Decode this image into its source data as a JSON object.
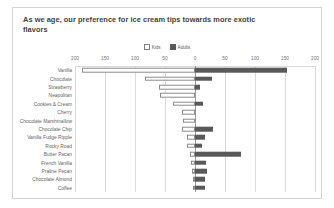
{
  "chart_data": {
    "type": "bar",
    "subtype": "diverging-tornado",
    "title": "As we age, our preference for ice cream tips towards more exotic flavors",
    "xlabel": "",
    "ylabel": "",
    "orientation": "horizontal",
    "grid": true,
    "legend_position": "top-center",
    "axis_zero_center": true,
    "xlim": [
      -200,
      200
    ],
    "tick_values": [
      -200,
      -150,
      -100,
      -50,
      0,
      50,
      100,
      150,
      200
    ],
    "tick_labels": [
      "200",
      "150",
      "100",
      "50",
      "0",
      "50",
      "100",
      "150",
      "200"
    ],
    "categories": [
      "Vanilla",
      "Chocolate",
      "Strawberry",
      "Neapolitan",
      "Cookies & Cream",
      "Cherry",
      "Chocolate Marshmallow",
      "Chocolate Chip",
      "Vanilla Fudge Ripple",
      "Rocky Road",
      "Butter Pecan",
      "French Vanilla",
      "Praline Pecan",
      "Chocolate Almond",
      "Coffee"
    ],
    "series": [
      {
        "name": "Kids",
        "direction": "left",
        "color": "#ffffff",
        "border_color": "#8c8c8c",
        "values": [
          188,
          83,
          60,
          58,
          37,
          22,
          20,
          21,
          14,
          13,
          9,
          6,
          5,
          4,
          4
        ]
      },
      {
        "name": "Adults",
        "direction": "right",
        "color": "#595959",
        "values": [
          154,
          28,
          9,
          0,
          14,
          0,
          0,
          30,
          17,
          11,
          76,
          18,
          20,
          16,
          17
        ]
      }
    ]
  },
  "legend": {
    "items": [
      {
        "label": "Kids",
        "swatch": "open-square"
      },
      {
        "label": "Adults",
        "swatch": "filled-square"
      }
    ]
  },
  "colors": {
    "kids_fill": "#ffffff",
    "kids_border": "#8c8c8c",
    "adults_fill": "#595959",
    "gridline": "#d9d9d9",
    "zero_line": "#9a9a9a",
    "card_border": "#d4d4d4",
    "title_text": "#3f3f3f",
    "label_text": "#636363"
  }
}
